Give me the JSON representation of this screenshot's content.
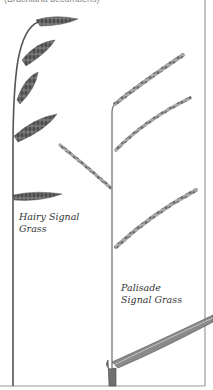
{
  "caption": {
    "text": "(Brachiaria decumbens)"
  },
  "labels": {
    "hairy": {
      "line1": "Hairy Signal",
      "line2": "Grass"
    },
    "palisade": {
      "line1": "Palisade",
      "line2": "Signal Grass"
    }
  },
  "colors": {
    "stem": "#5a5a5a",
    "spike": "#6b6b6b",
    "border": "#9a9a9a",
    "background": "#ffffff",
    "text": "#333333"
  }
}
